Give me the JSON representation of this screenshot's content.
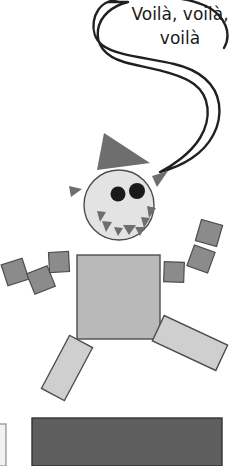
{
  "illustration": {
    "title": "Geometric robot character with speech bubble",
    "background_color": "#ffffff"
  },
  "speech_bubble": {
    "name": "speech-bubble",
    "line1": "Voilà, voilà,",
    "line2": "voilà",
    "text_color": "#1a1a1a",
    "outline_color": "#231f20",
    "fill_color": "#ffffff",
    "stroke_width": 2.4
  },
  "palette": {
    "light_gray": "#b9b9b9",
    "lighter_gray": "#cfcfcf",
    "medium_gray": "#8b8b8b",
    "dark_gray": "#6e6e6e",
    "head_fill": "#e3e3e3",
    "eye_fill": "#1a1a1a",
    "outline": "#4d4d4d",
    "outline_dark": "#333333",
    "floor_bar": "#5e5e5e"
  },
  "character": {
    "hat": {
      "name": "hat-triangle",
      "fill": "#6e6e6e",
      "points": "104,133 150,163 97,170"
    },
    "head": {
      "name": "head-circle",
      "fill": "#e3e3e3",
      "stroke": "#4d4d4d",
      "cx": 119,
      "cy": 205,
      "r": 35
    },
    "eyes": [
      {
        "name": "eye-left",
        "cx": 119,
        "cy": 194,
        "r": 7.5,
        "fill": "#1a1a1a"
      },
      {
        "name": "eye-right",
        "cx": 137,
        "cy": 191,
        "r": 8,
        "fill": "#1a1a1a"
      }
    ],
    "teeth": [
      {
        "name": "tooth-up-1",
        "points": "98,212 106,213 101,223",
        "fill": "#6e6e6e"
      },
      {
        "name": "tooth-up-2",
        "points": "103,222 112,223 107,233",
        "fill": "#6e6e6e"
      },
      {
        "name": "tooth-up-3",
        "points": "115,228 123,229 119,237",
        "fill": "#6e6e6e"
      },
      {
        "name": "tooth-down-1",
        "points": "124,226 136,226 130,236",
        "fill": "#6e6e6e"
      },
      {
        "name": "tooth-up-4",
        "points": "136,228 145,228 140,237",
        "fill": "#6e6e6e"
      },
      {
        "name": "tooth-up-5",
        "points": "142,218 150,219 145,229",
        "fill": "#6e6e6e"
      },
      {
        "name": "tooth-up-6",
        "points": "148,207 156,209 150,219",
        "fill": "#6e6e6e"
      }
    ],
    "spikes": [
      {
        "name": "spike-left",
        "points": "69,186 82,189 71,197",
        "fill": "#6e6e6e"
      },
      {
        "name": "spike-right",
        "points": "168,171 158,186 152,177",
        "fill": "#6e6e6e"
      }
    ],
    "body": {
      "name": "body-square",
      "fill": "#b9b9b9",
      "stroke": "#4d4d4d",
      "x": 77,
      "y": 255,
      "width": 83,
      "height": 84
    },
    "arm_blocks": [
      {
        "name": "arm-block-left-outer",
        "fill": "#8b8b8b",
        "cx": 15,
        "cy": 272,
        "size": 22,
        "rotate": -18
      },
      {
        "name": "arm-block-left-mid",
        "fill": "#8b8b8b",
        "cx": 41,
        "cy": 280,
        "size": 22,
        "rotate": -22
      },
      {
        "name": "arm-block-left-inner",
        "fill": "#8b8b8b",
        "cx": 59,
        "cy": 262,
        "size": 20,
        "rotate": -3
      },
      {
        "name": "arm-block-right-inner",
        "fill": "#8b8b8b",
        "cx": 174,
        "cy": 272,
        "size": 20,
        "rotate": 2
      },
      {
        "name": "arm-block-right-mid",
        "fill": "#8b8b8b",
        "cx": 201,
        "cy": 259,
        "size": 22,
        "rotate": 20
      },
      {
        "name": "arm-block-right-outer",
        "fill": "#8b8b8b",
        "cx": 209,
        "cy": 233,
        "size": 22,
        "rotate": 16
      }
    ],
    "legs": [
      {
        "name": "leg-left",
        "fill": "#cfcfcf",
        "stroke": "#4d4d4d",
        "cx": 67,
        "cy": 368,
        "width": 26,
        "height": 60,
        "rotate": 28
      },
      {
        "name": "leg-right",
        "fill": "#cfcfcf",
        "stroke": "#4d4d4d",
        "cx": 190,
        "cy": 343,
        "width": 28,
        "height": 70,
        "rotate": 115
      }
    ]
  },
  "scenery": {
    "floor_bar": {
      "name": "floor-bar",
      "fill": "#5e5e5e",
      "stroke": "#333333",
      "x": 32,
      "y": 418,
      "width": 190,
      "height": 48
    },
    "left_panel": {
      "name": "left-edge-panel",
      "fill": "#f2f2f2",
      "stroke": "#8b8b8b",
      "x": -6,
      "y": 424,
      "width": 12,
      "height": 42
    }
  }
}
